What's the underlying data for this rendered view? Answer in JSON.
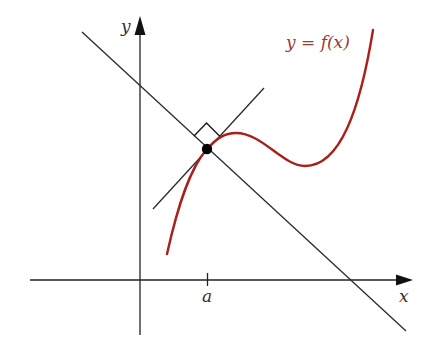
{
  "diagram": {
    "curve_label": "y = f(x)",
    "x_axis_label": "x",
    "y_axis_label": "y",
    "tick_label": "a",
    "colors": {
      "curve": "#a8201a",
      "axes": "#222222",
      "lines": "#2a2a2a",
      "label_curve": "#9a3a36",
      "point": "#000000"
    },
    "elements": [
      {
        "id": "x-axis",
        "type": "axis",
        "arrow": true
      },
      {
        "id": "y-axis",
        "type": "axis",
        "arrow": true
      },
      {
        "id": "curve",
        "type": "cubic-like curve",
        "description": "rises through point at x=a, local max, local min, then rises steeply"
      },
      {
        "id": "tangent-line",
        "type": "line",
        "description": "tangent to curve at (a, f(a))"
      },
      {
        "id": "normal-line",
        "type": "line",
        "description": "perpendicular to tangent at (a, f(a))"
      },
      {
        "id": "right-angle-marker",
        "type": "marker"
      },
      {
        "id": "point-of-tangency",
        "type": "point",
        "at": "(a, f(a))"
      }
    ]
  }
}
